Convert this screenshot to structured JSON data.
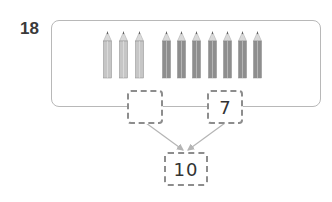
{
  "question": {
    "number": "18"
  },
  "pencils": {
    "light_count": 3,
    "dark_count": 7,
    "light_color": "#c6c6c6",
    "dark_color": "#8e8e8e"
  },
  "number_bond": {
    "left_part": "",
    "right_part": "7",
    "whole": "10"
  },
  "colors": {
    "frame_border": "#b8b8b8",
    "box_border": "#8d8d8d",
    "arrow": "#b5b5b5"
  }
}
